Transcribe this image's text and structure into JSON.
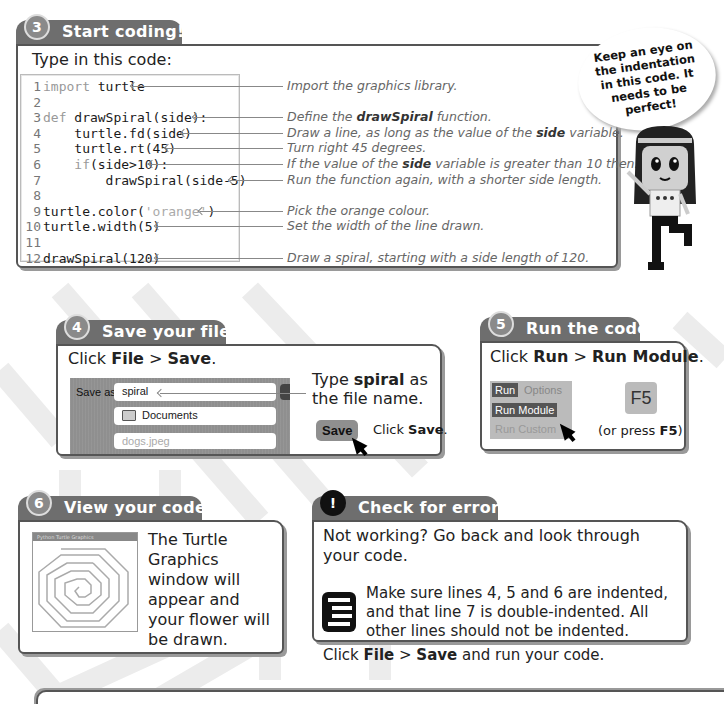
{
  "step3": {
    "number": "3",
    "title": "Start coding!",
    "intro": "Type in this code:",
    "code_lines": [
      {
        "n": "1",
        "kw": "import",
        "rest": " turtle"
      },
      {
        "n": "2",
        "kw": "",
        "rest": ""
      },
      {
        "n": "3",
        "kw": "def",
        "rest": " drawSpiral(side):"
      },
      {
        "n": "4",
        "kw": "",
        "rest": "    turtle.fd(side)"
      },
      {
        "n": "5",
        "kw": "",
        "rest": "    turtle.rt(45)"
      },
      {
        "n": "6",
        "kw": "    if",
        "rest": "(side>10):"
      },
      {
        "n": "7",
        "kw": "",
        "rest": "        drawSpiral(side-5)"
      },
      {
        "n": "8",
        "kw": "",
        "rest": ""
      },
      {
        "n": "9",
        "kw": "",
        "rest": "turtle.color(",
        "str": "'orange'",
        "tail": ")"
      },
      {
        "n": "10",
        "kw": "",
        "rest": "turtle.width(5)"
      },
      {
        "n": "11",
        "kw": "",
        "rest": ""
      },
      {
        "n": "12",
        "kw": "",
        "rest": "drawSpiral(120)"
      }
    ],
    "annotations": [
      {
        "line": 1,
        "text": "Import the graphics library."
      },
      {
        "line": 3,
        "pre": "Define the ",
        "bold": "drawSpiral",
        "post": " function."
      },
      {
        "line": 4,
        "pre": "Draw a line, as long as the value of the ",
        "bold": "side",
        "post": " variable."
      },
      {
        "line": 5,
        "text": "Turn right 45 degrees."
      },
      {
        "line": 6,
        "pre": "If the value of the ",
        "bold": "side",
        "post": " variable is greater than 10 then:"
      },
      {
        "line": 7,
        "text": "Run the function again, with a shorter side length."
      },
      {
        "line": 9,
        "text": "Pick the orange colour."
      },
      {
        "line": 10,
        "text": "Set the width of the line drawn."
      },
      {
        "line": 12,
        "text": "Draw a spiral, starting with a side length of 120."
      }
    ],
    "speech_bubble": "Keep an eye on the indentation in this code. It needs to be perfect!"
  },
  "step4": {
    "number": "4",
    "title": "Save your file",
    "instruction": {
      "pre": "Click ",
      "b1": "File",
      "mid": " > ",
      "b2": "Save",
      "post": "."
    },
    "dialog": {
      "save_as_label": "Save as:",
      "filename_value": "spiral",
      "folder": "Documents",
      "file_item": "dogs.jpeg",
      "save_button": "Save"
    },
    "type_note": {
      "pre": "Type ",
      "bold": "spiral",
      "post": " as the file name."
    },
    "click_note": {
      "pre": "Click ",
      "bold": "Save",
      "post": "."
    }
  },
  "step5": {
    "number": "5",
    "title": "Run the code",
    "instruction": {
      "pre": "Click ",
      "b1": "Run",
      "mid": " > ",
      "b2": "Run Module",
      "post": "."
    },
    "menu": {
      "run": "Run",
      "options": "Options",
      "run_module": "Run Module",
      "run_custom": "Run Custom"
    },
    "key": "F5",
    "key_note": {
      "pre": "(or press ",
      "bold": "F5",
      "post": ")"
    }
  },
  "step6": {
    "number": "6",
    "title": "View your code",
    "window_title": "Python Turtle Graphics",
    "description": "The Turtle Graphics window will appear and your flower will be drawn."
  },
  "check": {
    "number": "!",
    "title": "Check for errors",
    "intro": "Not working? Go back and look through your code.",
    "tip": "Make sure lines 4, 5 and 6 are indented, and that line 7 is double-indented. All other lines should not be indented.",
    "footer": {
      "pre": "Click ",
      "b1": "File",
      "mid": " > ",
      "b2": "Save",
      "post": " and run your code."
    }
  }
}
